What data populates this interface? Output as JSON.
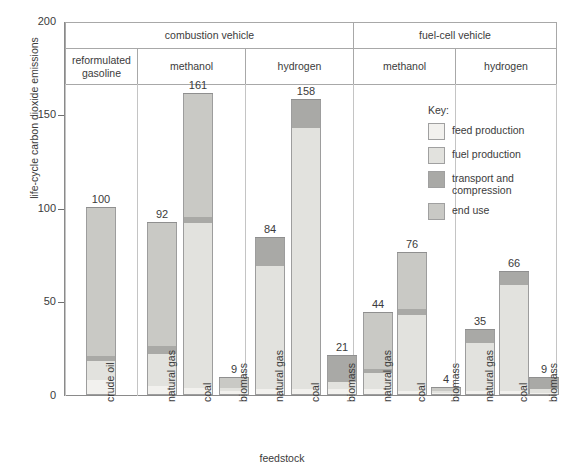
{
  "chart_data": {
    "type": "bar",
    "subtype": "stacked-bar",
    "title": "",
    "xlabel": "feedstock",
    "ylabel": "life-cycle carbon dioxide emissions",
    "ylim": [
      0,
      200
    ],
    "yticks": [
      0,
      50,
      100,
      150,
      200
    ],
    "grid": false,
    "legend_position": "inside-right",
    "group_headers_level1": [
      {
        "label": "combustion vehicle",
        "span": 4
      },
      {
        "label": "fuel-cell vehicle",
        "span": 3
      }
    ],
    "group_headers_level2": [
      {
        "label": "reformulated gasoline",
        "span": 1
      },
      {
        "label": "methanol",
        "span": 3
      },
      {
        "label": "hydrogen",
        "span": 3
      },
      {
        "label": "methanol",
        "span": 3
      },
      {
        "label": "hydrogen",
        "span": 3
      }
    ],
    "series": [
      {
        "name": "feed production",
        "color": "#f2f1ee"
      },
      {
        "name": "fuel production",
        "color": "#e2e2de"
      },
      {
        "name": "transport and compression",
        "color": "#a9a9a6"
      },
      {
        "name": "end use",
        "color": "#c9c9c5"
      }
    ],
    "categories": [
      "crude oil",
      "natural gas",
      "coal",
      "biomass",
      "natural gas",
      "coal",
      "biomass",
      "natural gas",
      "coal",
      "biomass",
      "natural gas",
      "coal",
      "biomass"
    ],
    "totals": [
      100,
      92,
      161,
      9,
      84,
      158,
      21,
      44,
      76,
      4,
      35,
      66,
      9
    ],
    "bars": [
      {
        "category": "crude oil",
        "vehicle": "combustion vehicle",
        "fuel": "reformulated gasoline",
        "total": 100,
        "feed_production": 8,
        "fuel_production": 10,
        "transport_and_compression": 3,
        "end_use": 79
      },
      {
        "category": "natural gas",
        "vehicle": "combustion vehicle",
        "fuel": "methanol",
        "total": 92,
        "feed_production": 5,
        "fuel_production": 17,
        "transport_and_compression": 4,
        "end_use": 66
      },
      {
        "category": "coal",
        "vehicle": "combustion vehicle",
        "fuel": "methanol",
        "total": 161,
        "feed_production": 4,
        "fuel_production": 88,
        "transport_and_compression": 3,
        "end_use": 66
      },
      {
        "category": "biomass",
        "vehicle": "combustion vehicle",
        "fuel": "methanol",
        "total": 9,
        "feed_production": 2,
        "fuel_production": 2,
        "transport_and_compression": 0,
        "end_use": 5
      },
      {
        "category": "natural gas",
        "vehicle": "combustion vehicle",
        "fuel": "hydrogen",
        "total": 84,
        "feed_production": 3,
        "fuel_production": 66,
        "transport_and_compression": 15,
        "end_use": 0
      },
      {
        "category": "coal",
        "vehicle": "combustion vehicle",
        "fuel": "hydrogen",
        "total": 158,
        "feed_production": 3,
        "fuel_production": 140,
        "transport_and_compression": 15,
        "end_use": 0
      },
      {
        "category": "biomass",
        "vehicle": "combustion vehicle",
        "fuel": "hydrogen",
        "total": 21,
        "feed_production": 3,
        "fuel_production": 4,
        "transport_and_compression": 14,
        "end_use": 0
      },
      {
        "category": "natural gas",
        "vehicle": "fuel-cell vehicle",
        "fuel": "methanol",
        "total": 44,
        "feed_production": 3,
        "fuel_production": 9,
        "transport_and_compression": 2,
        "end_use": 30
      },
      {
        "category": "coal",
        "vehicle": "fuel-cell vehicle",
        "fuel": "methanol",
        "total": 76,
        "feed_production": 2,
        "fuel_production": 41,
        "transport_and_compression": 3,
        "end_use": 30
      },
      {
        "category": "biomass",
        "vehicle": "fuel-cell vehicle",
        "fuel": "methanol",
        "total": 4,
        "feed_production": 1,
        "fuel_production": 1,
        "transport_and_compression": 0,
        "end_use": 2
      },
      {
        "category": "natural gas",
        "vehicle": "fuel-cell vehicle",
        "fuel": "hydrogen",
        "total": 35,
        "feed_production": 2,
        "fuel_production": 26,
        "transport_and_compression": 7,
        "end_use": 0
      },
      {
        "category": "coal",
        "vehicle": "fuel-cell vehicle",
        "fuel": "hydrogen",
        "total": 66,
        "feed_production": 2,
        "fuel_production": 57,
        "transport_and_compression": 7,
        "end_use": 0
      },
      {
        "category": "biomass",
        "vehicle": "fuel-cell vehicle",
        "fuel": "hydrogen",
        "total": 9,
        "feed_production": 1,
        "fuel_production": 2,
        "transport_and_compression": 6,
        "end_use": 0
      }
    ]
  },
  "axis": {
    "ylabel": "life-cycle carbon dioxide emissions",
    "xlabel": "feedstock",
    "ytick_0": "0",
    "ytick_50": "50",
    "ytick_100": "100",
    "ytick_150": "150",
    "ytick_200": "200"
  },
  "headers": {
    "combustion": "combustion vehicle",
    "fuelcell": "fuel-cell vehicle",
    "reformulated_gasoline": "reformulated gasoline",
    "methanol_1": "methanol",
    "hydrogen_1": "hydrogen",
    "methanol_2": "methanol",
    "hydrogen_2": "hydrogen"
  },
  "legend": {
    "title": "Key:",
    "items": [
      {
        "label": "feed production",
        "color": "#f2f1ee"
      },
      {
        "label": "fuel production",
        "color": "#e2e2de"
      },
      {
        "label": "transport and compression",
        "color": "#a9a9a6"
      },
      {
        "label": "end use",
        "color": "#c9c9c5"
      }
    ]
  },
  "xlabels": [
    "crude oil",
    "natural gas",
    "coal",
    "biomass",
    "natural gas",
    "coal",
    "biomass",
    "natural gas",
    "coal",
    "biomass",
    "natural gas",
    "coal",
    "biomass"
  ]
}
